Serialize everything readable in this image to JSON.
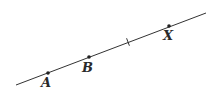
{
  "diagram": {
    "line": {
      "x1": 16,
      "y1": 85,
      "x2": 206,
      "y2": 13,
      "color": "#333333",
      "width": 1
    },
    "tick": {
      "x": 128,
      "y": 42,
      "len": 5
    },
    "points": [
      {
        "id": "A",
        "label": "A",
        "x": 48,
        "y": 73,
        "lx": 41,
        "ly": 87
      },
      {
        "id": "B",
        "label": "B",
        "x": 89,
        "y": 57,
        "lx": 82,
        "ly": 72
      },
      {
        "id": "X",
        "label": "X",
        "x": 169,
        "y": 26,
        "lx": 163,
        "ly": 40
      }
    ]
  }
}
